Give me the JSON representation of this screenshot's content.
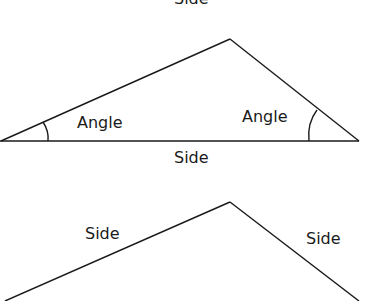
{
  "figure": {
    "stroke_color": "#1a1a1a",
    "background": "#ffffff",
    "top_triangle": {
      "top_label": "Side",
      "left_angle_label": "Angle",
      "right_angle_label": "Angle",
      "base_label": "Side",
      "vertices": [
        [
          0,
          141
        ],
        [
          230,
          39
        ],
        [
          359,
          141
        ]
      ]
    },
    "bottom_triangle": {
      "left_side_label": "Side",
      "right_side_label": "Side",
      "vertices": [
        [
          0,
          301
        ],
        [
          230,
          202
        ],
        [
          359,
          301
        ]
      ]
    }
  }
}
